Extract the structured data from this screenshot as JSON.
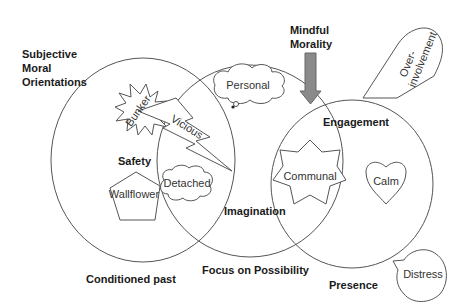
{
  "diagram": {
    "title_lines": [
      "Subjective",
      "Moral",
      "Orientations"
    ],
    "top_arrow_label_lines": [
      "Mindful",
      "Morality"
    ],
    "circles": [
      {
        "label": "Conditioned past",
        "inner_label": "Safety"
      },
      {
        "label": "Focus on Possibility",
        "inner_label": "Imagination"
      },
      {
        "label": "Presence",
        "inner_label": "Engagement"
      }
    ],
    "shapes": {
      "bunker": "Bunker",
      "vicious": "Vicious",
      "personal": "Personal",
      "wallflower": "Wallflower",
      "detached": "Detached",
      "communal": "Communal",
      "calm": "Calm",
      "overinvolvement_lines": [
        "Over-",
        "involvement"
      ],
      "distress": "Distress"
    },
    "colors": {
      "stroke": "#555555",
      "arrow_fill": "#8a8a8a",
      "background": "#ffffff"
    }
  }
}
